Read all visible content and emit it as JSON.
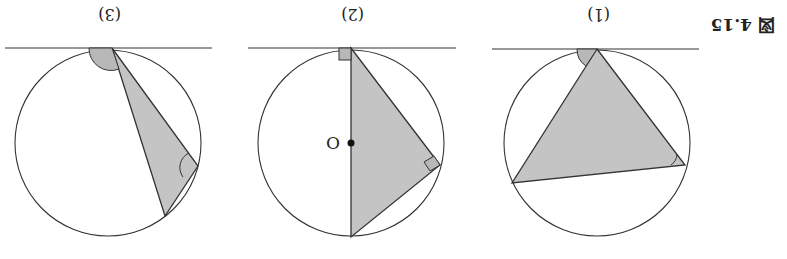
{
  "figure": {
    "caption": "図 4.15",
    "orientation": "rotated-180",
    "stroke_color": "#333333",
    "fill_color": "#c4c4c4",
    "panels": [
      {
        "label": "(1)",
        "description": "Triangle inscribed in circle with tangent line; angle between tangent and chord equals inscribed angle"
      },
      {
        "label": "(2)",
        "description": "Right triangle with diameter through center O; tangent perpendicular to diameter",
        "center_label": "O"
      },
      {
        "label": "(3)",
        "description": "Obtuse case: tangent-chord angle equals inscribed angle on opposite arc"
      }
    ]
  }
}
